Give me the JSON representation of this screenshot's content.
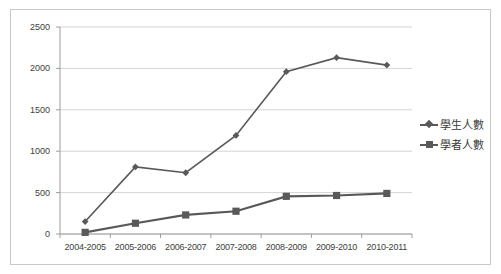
{
  "chart_data": {
    "type": "line",
    "title": "",
    "xlabel": "",
    "ylabel": "",
    "ylim": [
      0,
      2500
    ],
    "ytick_values": [
      0,
      500,
      1000,
      1500,
      2000,
      2500
    ],
    "ytick_labels": [
      "0",
      "500",
      "1000",
      "1500",
      "2000",
      "2500"
    ],
    "grid": true,
    "legend_position": "right",
    "categories": [
      "2004-2005",
      "2005-2006",
      "2006-2007",
      "2007-2008",
      "2008-2009",
      "2009-2010",
      "2010-2011"
    ],
    "series": [
      {
        "name": "學生人數",
        "marker": "diamond",
        "color": "#595959",
        "values": [
          150,
          810,
          740,
          1190,
          1960,
          2130,
          2040
        ]
      },
      {
        "name": "學者人數",
        "marker": "square",
        "color": "#595959",
        "values": [
          20,
          130,
          230,
          275,
          455,
          465,
          490
        ]
      }
    ]
  }
}
